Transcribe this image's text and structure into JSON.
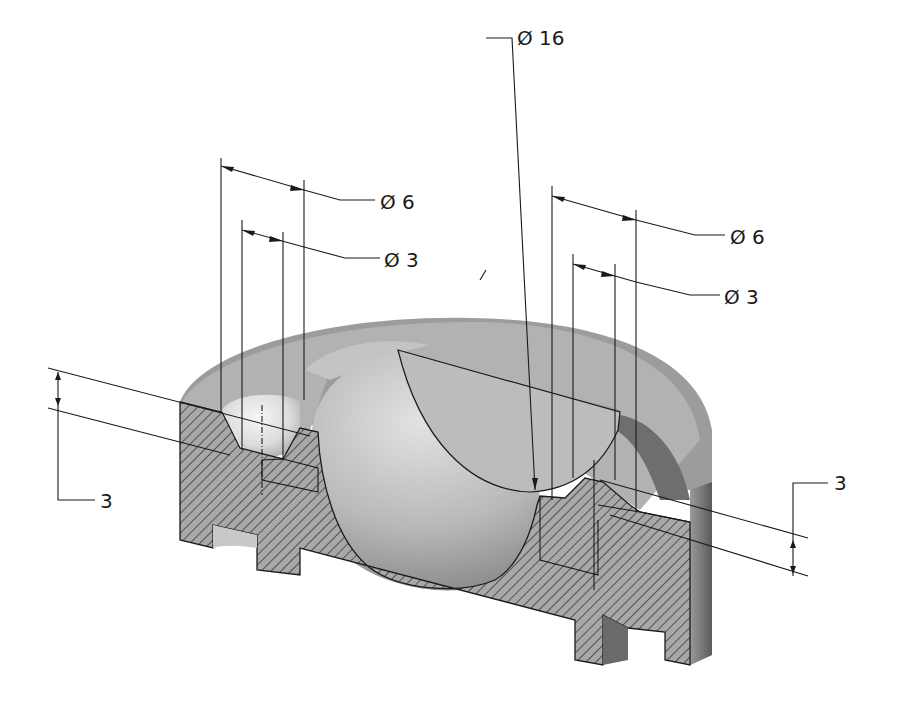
{
  "drawing": {
    "title": "Sectioned isometric view of nozzle plate",
    "view_type": "isometric half-section",
    "colors": {
      "background": "#ffffff",
      "body_outer": "#9a9a9a",
      "body_top": "#bdbdbd",
      "hatch_fill": "#a8a8a8",
      "hatch_line": "#3a3a3a",
      "sphere_light": "#d8d8d8",
      "sphere_dark": "#8c8c8c",
      "line": "#1a1a1a"
    }
  },
  "dimensions": {
    "center_bore": {
      "symbol": "Ø",
      "value": "16",
      "label": "Ø 16"
    },
    "left_outer_hole": {
      "symbol": "Ø",
      "value": "6",
      "label": "Ø 6"
    },
    "left_inner_hole": {
      "symbol": "Ø",
      "value": "3",
      "label": "Ø 3"
    },
    "right_outer_hole": {
      "symbol": "Ø",
      "value": "6",
      "label": "Ø 6"
    },
    "right_inner_hole": {
      "symbol": "Ø",
      "value": "3",
      "label": "Ø 3"
    },
    "left_depth": {
      "value": "3",
      "label": "3"
    },
    "right_depth": {
      "value": "3",
      "label": "3"
    }
  }
}
